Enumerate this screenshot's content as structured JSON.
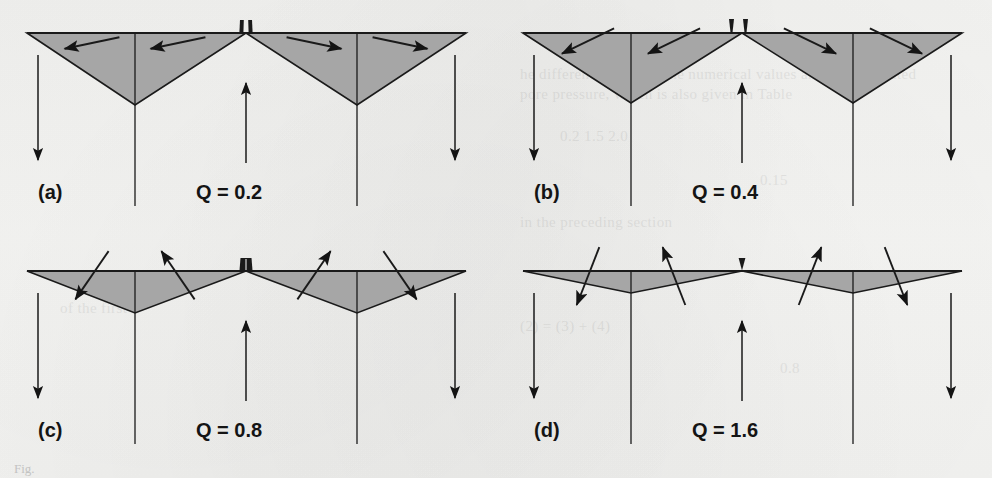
{
  "figure": {
    "caption_stub": "Fig.",
    "background_color": "#f4f4f2",
    "ink_color": "#141414",
    "cone_fill_color": "#a6a6a6",
    "cone_stroke_color": "#1a1a1a"
  },
  "chart_data": {
    "type": "diagram",
    "xlabel": "",
    "ylabel": "",
    "grid": false,
    "legend": "none",
    "series": [
      {
        "name": "cone_half_width_px",
        "categories": [
          "0.2",
          "0.4",
          "0.8",
          "1.6"
        ],
        "values": [
          109,
          109,
          109,
          109
        ]
      },
      {
        "name": "cone_depth_px",
        "categories": [
          "0.2",
          "0.4",
          "0.8",
          "1.6"
        ],
        "values": [
          72,
          70,
          42,
          22
        ]
      },
      {
        "name": "arrow_inclination_deg",
        "categories": [
          "0.2",
          "0.4",
          "0.8",
          "1.6"
        ],
        "values": [
          12,
          26,
          52,
          66
        ]
      }
    ],
    "panels": [
      {
        "id": "a",
        "label": "(a)",
        "q_label": "Q = 0.2",
        "q_value": 0.2,
        "nozzle_count": 1,
        "nozzle_style": "double-prong",
        "cone_depth": 72,
        "arrow_inclination": 12,
        "arrow_direction": "shallow-outward-horizontal"
      },
      {
        "id": "b",
        "label": "(b)",
        "q_label": "Q = 0.4",
        "q_value": 0.4,
        "nozzle_count": 2,
        "nozzle_style": "twin-separated",
        "cone_depth": 70,
        "arrow_inclination": 26,
        "arrow_direction": "inclined-outward"
      },
      {
        "id": "c",
        "label": "(c)",
        "q_label": "Q = 0.8",
        "q_value": 0.8,
        "nozzle_count": 1,
        "nozzle_style": "single-stub",
        "cone_depth": 42,
        "arrow_inclination": 52,
        "arrow_direction": "steep-crossing"
      },
      {
        "id": "d",
        "label": "(d)",
        "q_label": "Q = 1.6",
        "q_value": 1.6,
        "nozzle_count": 1,
        "nozzle_style": "small-triangle",
        "cone_depth": 22,
        "arrow_inclination": 66,
        "arrow_direction": "near-vertical-crossing"
      }
    ],
    "axis_ranges": {
      "q": [
        0.2,
        1.6
      ]
    },
    "annotations": [
      "Outer vertical arrows point downward (subsidence)",
      "Central vertical arrow points upward (uplift / injection)",
      "Four vertical reference lines per panel mark cone apex positions and panel edges"
    ]
  },
  "ghost_text": [
    {
      "x": 520,
      "y": 66,
      "text": "he difference between the numerical values and the calculated"
    },
    {
      "x": 520,
      "y": 86,
      "text": "pore pressure, which is also given in Table"
    },
    {
      "x": 560,
      "y": 128,
      "text": "0.2          1.5          2.0"
    },
    {
      "x": 760,
      "y": 172,
      "text": "0.15"
    },
    {
      "x": 520,
      "y": 214,
      "text": "in the preceding section"
    },
    {
      "x": 560,
      "y": 268,
      "text": "0.20      0.35      0.50"
    },
    {
      "x": 520,
      "y": 318,
      "text": "(2) = (3) + (4)"
    },
    {
      "x": 60,
      "y": 300,
      "text": "of the first"
    },
    {
      "x": 780,
      "y": 360,
      "text": "0.8"
    }
  ]
}
